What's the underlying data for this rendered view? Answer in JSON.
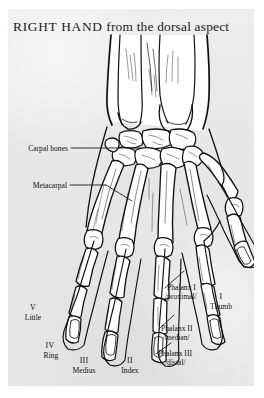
{
  "page": {
    "title_caps": "RIGHT HAND",
    "title_rest": " from the dorsal aspect",
    "background_color": "#e8e8e8",
    "margin_color": "#ffffff",
    "ink_color": "#111111"
  },
  "labels": {
    "carpal_bones": "Carpal bones",
    "metacarpal": "Metacarpal",
    "phalanx_1": "Phalanx I",
    "phalanx_1_sub": "/proximal/",
    "phalanx_2": "Phalanx II",
    "phalanx_2_sub": "/median/",
    "phalanx_3": "Phalanx III",
    "phalanx_3_sub": "/distal/"
  },
  "digits": [
    {
      "numeral": "V",
      "name": "Little"
    },
    {
      "numeral": "IV",
      "name": "Ring"
    },
    {
      "numeral": "III",
      "name": "Medius"
    },
    {
      "numeral": "II",
      "name": "Index"
    },
    {
      "numeral": "I",
      "name": "Thumb"
    }
  ]
}
